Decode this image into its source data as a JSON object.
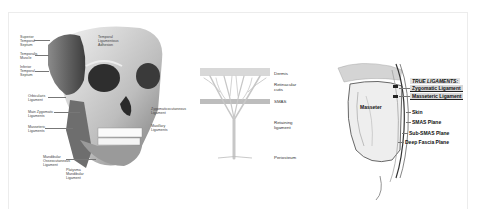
{
  "figure": {
    "panels": [
      {
        "id": "skull-ligaments",
        "description": "Facial skull with retaining ligaments illustration",
        "labels": [
          {
            "text": "Superior\nTemporal\nSeptum"
          },
          {
            "text": "Temporalis\nMuscle"
          },
          {
            "text": "Inferior\nTemporal\nSeptum"
          },
          {
            "text": "Orbicularis\nLigament"
          },
          {
            "text": "Main Zygomatic\nLigaments"
          },
          {
            "text": "Masseteric\nLigaments"
          },
          {
            "text": "Mandibular\nOsseocutaneous\nLigament"
          },
          {
            "text": "Platysma\nMandibular\nLigament"
          },
          {
            "text": "Temporal\nLigamentous\nAdhesion"
          },
          {
            "text": "Zygomaticocutaneous\nLigament"
          },
          {
            "text": "Maxillary\nLigaments"
          }
        ]
      },
      {
        "id": "retaining-ligament-layers",
        "description": "Tree-shaped retaining ligament passing through facial layers",
        "labels": [
          {
            "text": "Dermis"
          },
          {
            "text": "Retinacular\ncutis"
          },
          {
            "text": "SMAS"
          },
          {
            "text": "Retaining\nligament"
          },
          {
            "text": "Periosteum"
          }
        ]
      },
      {
        "id": "true-ligaments-planes",
        "description": "Cross-section showing true ligaments and facial planes over masseter",
        "title": "TRUE LIGAMENTS:",
        "highlighted": [
          {
            "text": "Zygomatic Ligament"
          },
          {
            "text": "Masseteric Ligament"
          }
        ],
        "labels": [
          {
            "text": "Masseter"
          },
          {
            "text": "Skin"
          },
          {
            "text": "SMAS Plane"
          },
          {
            "text": "Sub-SMAS Plane"
          },
          {
            "text": "Deep Fascia Plane"
          }
        ]
      }
    ]
  }
}
